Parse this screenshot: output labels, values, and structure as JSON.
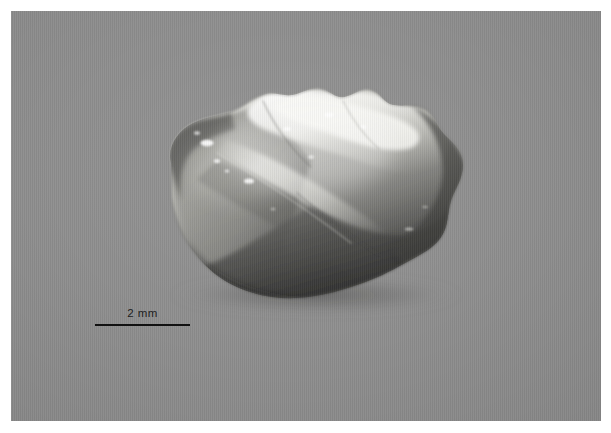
{
  "figure": {
    "kind": "specimen-macrophotograph",
    "background_color": "#8e8e8e",
    "plate_color": "#ffffff",
    "border_width_px": 11
  },
  "scale_bar": {
    "label": "2 mm",
    "line_length_px": 95,
    "line_color": "#111111",
    "text_color": "#1d1d1d",
    "position": "lower-left"
  },
  "specimen": {
    "name": "quartz-flake",
    "body_light": "#c9c9c4",
    "body_mid": "#9a9a95",
    "body_dark": "#4e4e4c",
    "body_deep_shadow": "#2b2b2a",
    "highlight": "#f2f2ee",
    "outline": "#5b5b58",
    "bounds": {
      "left_px": 154,
      "top_px": 86,
      "right_px": 456,
      "bottom_px": 290
    }
  }
}
